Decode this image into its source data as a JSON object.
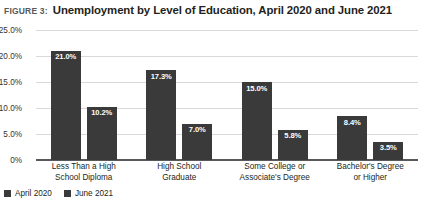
{
  "figure": {
    "number_label": "FIGURE 3:",
    "title": "Unemployment by Level of Education, April 2020 and June 2021"
  },
  "chart_data": {
    "type": "bar",
    "title": "Unemployment by Level of Education, April 2020 and June 2021",
    "xlabel": "",
    "ylabel": "",
    "ylim": [
      0,
      25
    ],
    "yticks": [
      "0%",
      "5.0%",
      "10.0%",
      "15.0%",
      "20.0%",
      "25.0%"
    ],
    "ytick_values": [
      0,
      5,
      10,
      15,
      20,
      25
    ],
    "grid": true,
    "legend_position": "bottom-left",
    "categories": [
      "Less Than a High School Diploma",
      "High School Graduate",
      "Some College or Associate's Degree",
      "Bachelor's Degree or Higher"
    ],
    "category_lines": [
      [
        "Less Than a High",
        "School Diploma"
      ],
      [
        "High School",
        "Graduate"
      ],
      [
        "Some College or",
        "Associate's Degree"
      ],
      [
        "Bachelor's Degree",
        "or Higher"
      ]
    ],
    "series": [
      {
        "name": "April 2020",
        "color": "#3a3a3a",
        "values": [
          21.0,
          17.3,
          15.0,
          8.4
        ],
        "labels": [
          "21.0%",
          "17.3%",
          "15.0%",
          "8.4%"
        ]
      },
      {
        "name": "June 2021",
        "color": "#3a3a3a",
        "values": [
          10.2,
          7.0,
          5.8,
          3.5
        ],
        "labels": [
          "10.2%",
          "7.0%",
          "5.8%",
          "3.5%"
        ]
      }
    ]
  },
  "legend": [
    {
      "label": "April 2020",
      "color": "#3a3a3a"
    },
    {
      "label": "June 2021",
      "color": "#3a3a3a"
    }
  ]
}
